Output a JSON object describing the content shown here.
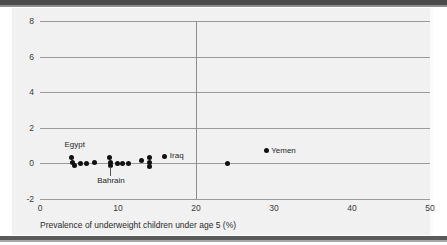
{
  "chart_data": {
    "type": "scatter",
    "title": "",
    "xlabel": "Prevalence of underweight children under age 5 (%)",
    "ylabel": "",
    "xlim": [
      0,
      50
    ],
    "ylim": [
      -2,
      8
    ],
    "xticks": [
      "0",
      "10",
      "20",
      "30",
      "40",
      "50"
    ],
    "yticks": [
      "8",
      "6",
      "4",
      "2",
      "0",
      "-2"
    ],
    "grid": "horizontal",
    "legend": "none",
    "reference_lines": [
      {
        "name": "vertical-reference-20",
        "orientation": "vertical",
        "value": 20
      }
    ],
    "points": [
      {
        "x": 4.0,
        "y": 0.35
      },
      {
        "x": 4.2,
        "y": 0.05
      },
      {
        "x": 4.4,
        "y": -0.1
      },
      {
        "x": 5.2,
        "y": 0.0
      },
      {
        "x": 5.9,
        "y": 0.0
      },
      {
        "x": 7.0,
        "y": 0.05
      },
      {
        "x": 8.9,
        "y": 0.35
      },
      {
        "x": 9.0,
        "y": 0.05
      },
      {
        "x": 9.1,
        "y": -0.1
      },
      {
        "x": 9.9,
        "y": 0.0
      },
      {
        "x": 10.6,
        "y": 0.0
      },
      {
        "x": 11.4,
        "y": 0.0
      },
      {
        "x": 13.0,
        "y": 0.15
      },
      {
        "x": 14.0,
        "y": 0.35
      },
      {
        "x": 14.1,
        "y": 0.05
      },
      {
        "x": 14.1,
        "y": -0.15
      },
      {
        "x": 16.0,
        "y": 0.4
      },
      {
        "x": 24.0,
        "y": 0.0
      },
      {
        "x": 29.0,
        "y": 0.7
      }
    ],
    "annotations": [
      {
        "name": "egypt",
        "label": "Egypt",
        "x": 4.3,
        "y": 0.35,
        "position": "above"
      },
      {
        "name": "bahrain",
        "label": "Bahrain",
        "x": 9.0,
        "y": 0.05,
        "position": "below-leader"
      },
      {
        "name": "iraq",
        "label": "Iraq",
        "x": 16.0,
        "y": 0.4,
        "position": "right"
      },
      {
        "name": "yemen",
        "label": "Yemen",
        "x": 29.0,
        "y": 0.7,
        "position": "right"
      }
    ],
    "colors": {
      "marker": "#111111",
      "gridline": "#9a9a9a",
      "reference_line": "#8c8c8c",
      "panel_background": "#f1f1f1",
      "page_background": "#ffffff",
      "rule": "#4a4a4a"
    }
  }
}
